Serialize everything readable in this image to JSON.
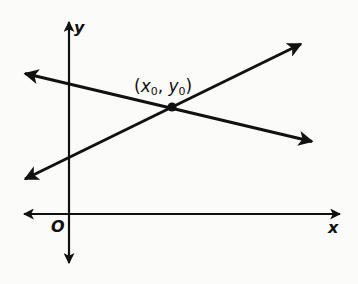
{
  "diagram": {
    "type": "coordinate-plane-two-intersecting-lines",
    "colors": {
      "background": "#fbfbfa",
      "stroke": "#111111"
    },
    "axes": {
      "x_label": "x",
      "y_label": "y",
      "origin_label": "O"
    },
    "lines": [
      {
        "name": "decreasing-line",
        "from": [
          23,
          73
        ],
        "to": [
          314,
          142
        ],
        "arrows": "both"
      },
      {
        "name": "increasing-line",
        "from": [
          23,
          180
        ],
        "to": [
          303,
          43
        ],
        "arrows": "both"
      }
    ],
    "intersection": {
      "label_open": "(",
      "x_var": "x",
      "x_sub": "0",
      "separator": ", ",
      "y_var": "y",
      "y_sub": "0",
      "label_close": ")",
      "point": [
        172,
        107
      ]
    }
  }
}
